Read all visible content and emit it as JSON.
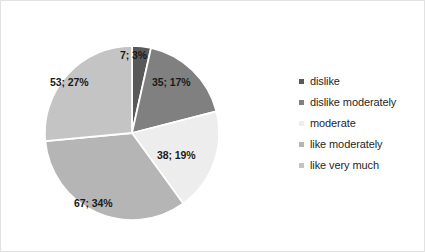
{
  "chart_data": {
    "type": "pie",
    "title": "",
    "subtitle": "",
    "xlabel": "",
    "ylabel": "",
    "grid": false,
    "legend_position": "right",
    "total": 200,
    "start_angle_deg": 0,
    "direction": "clockwise",
    "categories": [
      "dislike",
      "dislike moderately",
      "moderate",
      "like moderately",
      "like very much"
    ],
    "values": [
      7,
      35,
      38,
      67,
      53
    ],
    "percents": [
      3,
      17,
      19,
      34,
      27
    ],
    "data_labels": [
      "7; 3%",
      "35; 17%",
      "38; 19%",
      "67; 34%",
      "53; 27%"
    ],
    "colors": [
      "#595959",
      "#808080",
      "#ededed",
      "#b5b5b5",
      "#c4c4c4"
    ],
    "slice_border_color": "#ffffff",
    "slices": [
      {
        "label": "dislike",
        "value": 7,
        "percent": 3,
        "data_label": "7; 3%",
        "color": "#595959"
      },
      {
        "label": "dislike moderately",
        "value": 35,
        "percent": 17,
        "data_label": "35; 17%",
        "color": "#808080"
      },
      {
        "label": "moderate",
        "value": 38,
        "percent": 19,
        "data_label": "38; 19%",
        "color": "#ededed"
      },
      {
        "label": "like moderately",
        "value": 67,
        "percent": 34,
        "data_label": "67; 34%",
        "color": "#b5b5b5"
      },
      {
        "label": "like very much",
        "value": 53,
        "percent": 27,
        "data_label": "53; 27%",
        "color": "#c4c4c4"
      }
    ]
  },
  "legend": {
    "items": [
      {
        "label": "dislike",
        "color": "#595959",
        "has_marker": true
      },
      {
        "label": "dislike moderately",
        "color": "#808080",
        "has_marker": true
      },
      {
        "label": "moderate",
        "color": "#ededed",
        "has_marker": true
      },
      {
        "label": "like moderately",
        "color": "#b5b5b5",
        "has_marker": true
      },
      {
        "label": "like very much",
        "color": "#c4c4c4",
        "has_marker": true
      }
    ]
  },
  "frame": {
    "border_color": "#e2e2e2",
    "background": "#ffffff"
  }
}
